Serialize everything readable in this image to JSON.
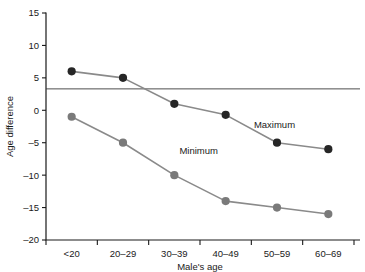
{
  "chart_data": {
    "type": "line",
    "title": "",
    "xlabel": "Male's age",
    "ylabel": "Age difference",
    "categories": [
      "<20",
      "20–29",
      "30–39",
      "40–49",
      "50–59",
      "60–69"
    ],
    "ylim": [
      -20,
      15
    ],
    "yticks": [
      -20,
      -15,
      -10,
      -5,
      0,
      5,
      10,
      15
    ],
    "ytick_labels": [
      "–20",
      "–15",
      "–10",
      "–5",
      "0",
      "5",
      "10",
      "15"
    ],
    "grid": false,
    "legend_position": "inline-annotation",
    "series": [
      {
        "name": "Maximum",
        "values": [
          6,
          5,
          1,
          -0.7,
          -5,
          -6
        ],
        "marker_color": "#262626",
        "line_color": "#8a8a8a",
        "label": "Maximum",
        "label_x_index": 3.55,
        "label_y": -2.2
      },
      {
        "name": "Minimum",
        "values": [
          -1,
          -5,
          -10,
          -14,
          -15,
          -16
        ],
        "marker_color": "#7a7a7a",
        "line_color": "#8a8a8a",
        "label": "Minimum",
        "label_x_index": 2.1,
        "label_y": -6.2
      }
    ],
    "annotations": [
      {
        "type": "hline",
        "value": 3.3,
        "color": "#3a3a3a",
        "label": ""
      }
    ]
  },
  "colors": {
    "axis": "#1a1a1a",
    "line": "#8a8a8a",
    "marker_max": "#262626",
    "marker_min": "#7a7a7a",
    "reference_line": "#3a3a3a",
    "background": "#ffffff"
  }
}
